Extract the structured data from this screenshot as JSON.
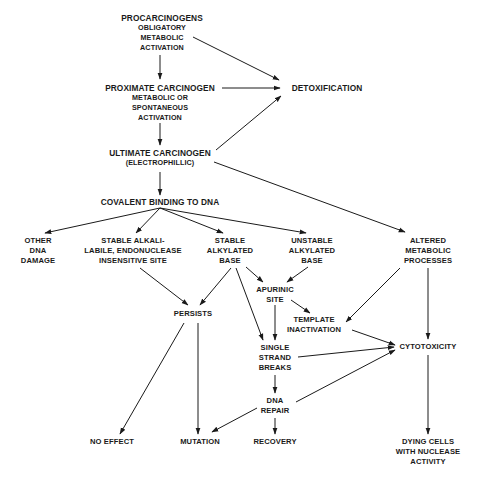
{
  "diagram": {
    "type": "flowchart",
    "nodes": {
      "procarcinogens": {
        "title": "PROCARCINOGENS",
        "sub": [
          "OBLIGATORY",
          "METABOLIC",
          "ACTIVATION"
        ]
      },
      "proximate": {
        "title": "PROXIMATE CARCINOGEN",
        "sub": [
          "METABOLIC OR",
          "SPONTANEOUS",
          "ACTIVATION"
        ]
      },
      "detoxification": {
        "title": "DETOXIFICATION"
      },
      "ultimate": {
        "title": "ULTIMATE CARCINOGEN",
        "sub": [
          "(ELECTROPHILLIC)"
        ]
      },
      "covalent": {
        "title": "COVALENT BINDING TO DNA"
      },
      "other_dna": {
        "lines": [
          "OTHER",
          "DNA",
          "DAMAGE"
        ]
      },
      "stable_alkali": {
        "lines": [
          "STABLE ALKALI-",
          "LABILE, ENDONUCLEASE",
          "INSENSITIVE SITE"
        ]
      },
      "stable_alkylated": {
        "lines": [
          "STABLE",
          "ALKYLATED",
          "BASE"
        ]
      },
      "unstable_alkylated": {
        "lines": [
          "UNSTABLE",
          "ALKYLATED",
          "BASE"
        ]
      },
      "altered_metabolic": {
        "lines": [
          "ALTERED",
          "METABOLIC",
          "PROCESSES"
        ]
      },
      "apurinic": {
        "lines": [
          "APURINIC",
          "SITE"
        ]
      },
      "persists": {
        "lines": [
          "PERSISTS"
        ]
      },
      "template": {
        "lines": [
          "TEMPLATE",
          "INACTIVATION"
        ]
      },
      "single_strand": {
        "lines": [
          "SINGLE",
          "STRAND",
          "BREAKS"
        ]
      },
      "cytotoxicity": {
        "lines": [
          "CYTOTOXICITY"
        ]
      },
      "dna_repair": {
        "lines": [
          "DNA",
          "REPAIR"
        ]
      },
      "no_effect": {
        "lines": [
          "NO EFFECT"
        ]
      },
      "mutation": {
        "lines": [
          "MUTATION"
        ]
      },
      "recovery": {
        "lines": [
          "RECOVERY"
        ]
      },
      "dying_cells": {
        "lines": [
          "DYING CELLS",
          "WITH NUCLEASE",
          "ACTIVITY"
        ]
      }
    },
    "edges": [
      [
        "procarcinogens",
        "proximate"
      ],
      [
        "procarcinogens",
        "detoxification"
      ],
      [
        "proximate",
        "detoxification"
      ],
      [
        "proximate",
        "ultimate"
      ],
      [
        "ultimate",
        "detoxification"
      ],
      [
        "ultimate",
        "covalent"
      ],
      [
        "ultimate",
        "altered_metabolic"
      ],
      [
        "covalent",
        "other_dna"
      ],
      [
        "covalent",
        "stable_alkali"
      ],
      [
        "covalent",
        "stable_alkylated"
      ],
      [
        "covalent",
        "unstable_alkylated"
      ],
      [
        "stable_alkali",
        "persists"
      ],
      [
        "stable_alkylated",
        "persists"
      ],
      [
        "stable_alkylated",
        "apurinic"
      ],
      [
        "stable_alkylated",
        "single_strand"
      ],
      [
        "unstable_alkylated",
        "apurinic"
      ],
      [
        "apurinic",
        "template"
      ],
      [
        "apurinic",
        "single_strand"
      ],
      [
        "altered_metabolic",
        "template"
      ],
      [
        "altered_metabolic",
        "cytotoxicity"
      ],
      [
        "template",
        "cytotoxicity"
      ],
      [
        "single_strand",
        "cytotoxicity"
      ],
      [
        "single_strand",
        "dna_repair"
      ],
      [
        "dna_repair",
        "cytotoxicity"
      ],
      [
        "dna_repair",
        "mutation"
      ],
      [
        "dna_repair",
        "recovery"
      ],
      [
        "persists",
        "no_effect"
      ],
      [
        "persists",
        "mutation"
      ],
      [
        "cytotoxicity",
        "dying_cells"
      ]
    ]
  }
}
